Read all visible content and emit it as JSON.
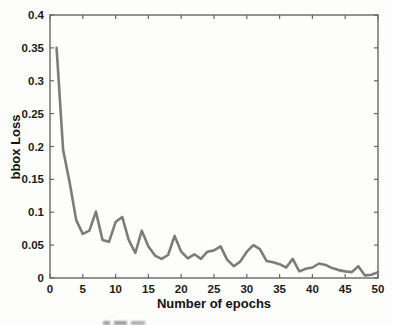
{
  "chart_data": {
    "type": "line",
    "title": "",
    "xlabel": "Number of epochs",
    "ylabel": "bbox Loss",
    "xlim": [
      0,
      50
    ],
    "ylim": [
      0,
      0.4
    ],
    "grid": false,
    "legend": null,
    "box": true,
    "x_ticks": [
      0,
      5,
      10,
      15,
      20,
      25,
      30,
      35,
      40,
      45,
      50
    ],
    "x_tick_labels": [
      "0",
      "5",
      "10",
      "15",
      "20",
      "25",
      "30",
      "35",
      "40",
      "45",
      "50"
    ],
    "y_ticks": [
      0,
      0.05,
      0.1,
      0.15,
      0.2,
      0.25,
      0.3,
      0.35,
      0.4
    ],
    "y_tick_labels": [
      "0",
      "0.05",
      "0.1",
      "0.15",
      "0.2",
      "0.25",
      "0.3",
      "0.35",
      "0.4"
    ],
    "colors": {
      "line": "#7c7c7c",
      "axis": "#666666",
      "tick_text": "#1b1b1b",
      "background": "#fdfdfc"
    },
    "series": [
      {
        "name": "bbox loss",
        "x": [
          1,
          2,
          3,
          4,
          5,
          6,
          7,
          8,
          9,
          10,
          11,
          12,
          13,
          14,
          15,
          16,
          17,
          18,
          19,
          20,
          21,
          22,
          23,
          24,
          25,
          26,
          27,
          28,
          29,
          30,
          31,
          32,
          33,
          34,
          35,
          36,
          37,
          38,
          39,
          40,
          41,
          42,
          43,
          44,
          45,
          46,
          47,
          48,
          49,
          50
        ],
        "values": [
          0.35,
          0.195,
          0.145,
          0.088,
          0.067,
          0.072,
          0.101,
          0.058,
          0.055,
          0.085,
          0.093,
          0.058,
          0.038,
          0.072,
          0.048,
          0.034,
          0.029,
          0.035,
          0.064,
          0.04,
          0.03,
          0.036,
          0.029,
          0.04,
          0.042,
          0.048,
          0.028,
          0.018,
          0.025,
          0.04,
          0.05,
          0.044,
          0.026,
          0.024,
          0.021,
          0.016,
          0.029,
          0.01,
          0.014,
          0.016,
          0.022,
          0.02,
          0.015,
          0.012,
          0.01,
          0.009,
          0.018,
          0.004,
          0.005,
          0.009
        ]
      }
    ]
  }
}
